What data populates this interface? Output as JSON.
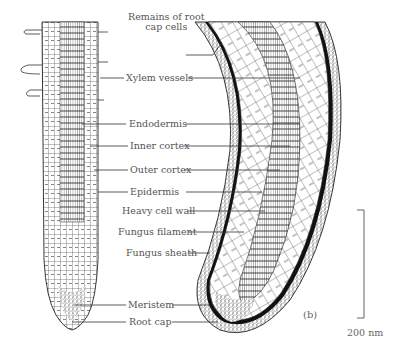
{
  "figure": {
    "panel_label": "(b)",
    "scale_bar_label": "200 nm",
    "labels": [
      {
        "id": "remains-root-cap",
        "line1": "Remains of root",
        "line2": "cap cells"
      },
      {
        "id": "xylem-vessels",
        "text": "Xylem vessels"
      },
      {
        "id": "endodermis",
        "text": "Endodermis"
      },
      {
        "id": "inner-cortex",
        "text": "Inner cortex"
      },
      {
        "id": "outer-cortex",
        "text": "Outer cortex"
      },
      {
        "id": "epidermis",
        "text": "Epidermis"
      },
      {
        "id": "heavy-cell-wall",
        "text": "Heavy cell wall"
      },
      {
        "id": "fungus-filament",
        "text": "Fungus filament"
      },
      {
        "id": "fungus-sheath",
        "text": "Fungus sheath"
      },
      {
        "id": "meristem",
        "text": "Meristem"
      },
      {
        "id": "root-cap",
        "text": "Root cap"
      }
    ]
  }
}
